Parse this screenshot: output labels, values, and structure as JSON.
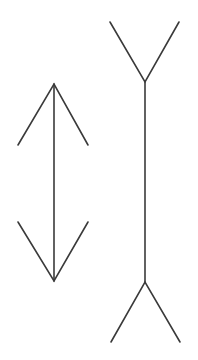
{
  "diagram": {
    "title": "",
    "type": "muller-lyer-illusion",
    "stroke_color": "#3a3a3a",
    "background": "#ffffff",
    "figures": [
      {
        "name": "arrowheads-inward",
        "shaft": {
          "x": 54,
          "y1": 84,
          "y2": 281
        },
        "top_fins": [
          [
            18,
            145
          ],
          [
            54,
            84
          ],
          [
            88,
            145
          ]
        ],
        "bottom_fins": [
          [
            18,
            222
          ],
          [
            54,
            281
          ],
          [
            88,
            222
          ]
        ]
      },
      {
        "name": "fins-outward",
        "shaft": {
          "x": 145,
          "y1": 82,
          "y2": 282
        },
        "top_fins": [
          [
            110,
            22
          ],
          [
            145,
            82
          ],
          [
            179,
            22
          ]
        ],
        "bottom_fins": [
          [
            111,
            342
          ],
          [
            145,
            282
          ],
          [
            180,
            342
          ]
        ]
      }
    ]
  }
}
